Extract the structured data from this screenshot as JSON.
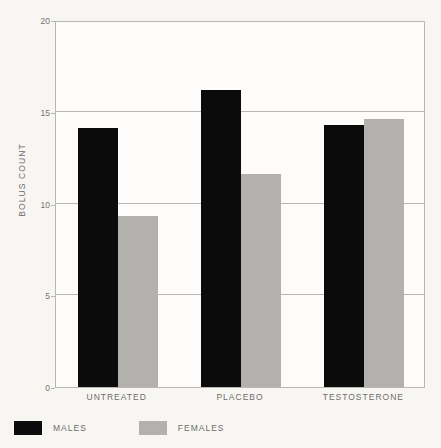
{
  "chart_data": {
    "type": "bar",
    "title": "",
    "xlabel": "",
    "ylabel": "BOLUS COUNT",
    "categories": [
      "UNTREATED",
      "PLACEBO",
      "TESTOSTERONE"
    ],
    "series": [
      {
        "name": "MALES",
        "color": "#0c0b0b",
        "values": [
          14.1,
          16.2,
          14.3
        ]
      },
      {
        "name": "FEMALES",
        "color": "#b2b1ae",
        "values": [
          9.3,
          11.6,
          14.6
        ]
      }
    ],
    "ylim": [
      0,
      20
    ],
    "yticks": [
      0,
      5,
      10,
      15,
      20
    ],
    "ytick_labels": [
      "0",
      "5",
      "10",
      "15",
      "20"
    ],
    "grid": true,
    "legend_position": "below-axes-left",
    "background_color": "#f8f6f3",
    "plot_background_color": "#fdfcfb",
    "axis_color": "#b9b7b4"
  }
}
